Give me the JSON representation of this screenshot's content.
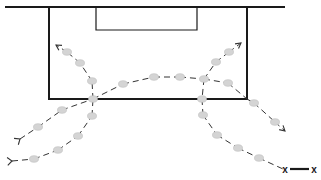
{
  "diagram": {
    "type": "soccer-drill",
    "width": 321,
    "height": 180,
    "colors": {
      "background": "#ffffff",
      "field_lines": "#1a1a1a",
      "pass_lines": "#333333",
      "ball_fill": "#d4d4d4",
      "ball_stroke": "#bdbdbd",
      "marker": "#1a1a1a"
    },
    "field": {
      "goal_line": {
        "x1": 5,
        "y1": 7,
        "x2": 285,
        "y2": 7
      },
      "penalty_box": {
        "x": 49,
        "y": 7,
        "width": 198,
        "height": 92
      },
      "goal_area": {
        "x": 96,
        "y": 7,
        "width": 101,
        "height": 23
      }
    },
    "paths": [
      {
        "name": "left-run-up",
        "points": [
          [
            93,
            99
          ],
          [
            92,
            81
          ],
          [
            80,
            63
          ],
          [
            67,
            52
          ],
          [
            56,
            45
          ]
        ],
        "arrow": "end"
      },
      {
        "name": "center-curve",
        "points": [
          [
            93,
            99
          ],
          [
            123,
            84
          ],
          [
            154,
            77
          ],
          [
            180,
            77
          ],
          [
            204,
            79
          ]
        ],
        "arrow": "none"
      },
      {
        "name": "right-run-up",
        "points": [
          [
            204,
            79
          ],
          [
            216,
            62
          ],
          [
            229,
            52
          ],
          [
            241,
            43
          ]
        ],
        "arrow": "end"
      },
      {
        "name": "right-drop",
        "points": [
          [
            204,
            79
          ],
          [
            202,
            99
          ]
        ],
        "arrow": "none"
      },
      {
        "name": "right-wide",
        "points": [
          [
            204,
            79
          ],
          [
            228,
            83
          ],
          [
            247,
            99
          ],
          [
            254,
            103
          ],
          [
            275,
            122
          ],
          [
            285,
            131
          ]
        ],
        "arrow": "end"
      },
      {
        "name": "left-lower-1",
        "points": [
          [
            20,
            139
          ],
          [
            38,
            127
          ],
          [
            62,
            110
          ],
          [
            93,
            99
          ]
        ],
        "arrow": "start-fork"
      },
      {
        "name": "left-lower-2",
        "points": [
          [
            12,
            161
          ],
          [
            34,
            159
          ],
          [
            58,
            150
          ],
          [
            78,
            136
          ],
          [
            92,
            116
          ],
          [
            93,
            99
          ]
        ],
        "arrow": "start-fork"
      },
      {
        "name": "right-lower",
        "points": [
          [
            202,
            99
          ],
          [
            203,
            115
          ],
          [
            217,
            135
          ],
          [
            238,
            148
          ],
          [
            259,
            158
          ],
          [
            283,
            169
          ]
        ],
        "arrow": "none"
      }
    ],
    "balls": [
      [
        67,
        52
      ],
      [
        80,
        63
      ],
      [
        92,
        81
      ],
      [
        93,
        99
      ],
      [
        123,
        84
      ],
      [
        154,
        77
      ],
      [
        180,
        77
      ],
      [
        204,
        79
      ],
      [
        216,
        62
      ],
      [
        229,
        52
      ],
      [
        228,
        83
      ],
      [
        254,
        103
      ],
      [
        275,
        122
      ],
      [
        202,
        99
      ],
      [
        203,
        115
      ],
      [
        217,
        135
      ],
      [
        238,
        148
      ],
      [
        259,
        158
      ],
      [
        38,
        127
      ],
      [
        62,
        110
      ],
      [
        34,
        159
      ],
      [
        58,
        150
      ],
      [
        78,
        136
      ],
      [
        92,
        116
      ]
    ],
    "markers": [
      {
        "label": "x",
        "x": 285,
        "y": 169
      },
      {
        "label": "x",
        "x": 314,
        "y": 169
      }
    ],
    "marker_link": {
      "x1": 290,
      "y1": 169,
      "x2": 309,
      "y2": 169
    }
  }
}
